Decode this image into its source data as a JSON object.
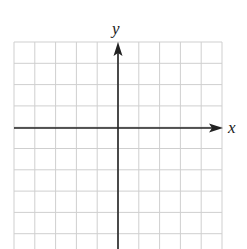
{
  "figure": {
    "type": "blank coordinate grid",
    "x_axis_label": "x",
    "y_axis_label": "y",
    "grid": {
      "columns": 10,
      "rows_visible": 10,
      "left": 14,
      "top": 42,
      "cell_width": 20.8,
      "cell_height": 21.3,
      "origin_column": 5,
      "origin_row": 4,
      "line_color": "#cfcfcf",
      "axis_color": "#222222"
    },
    "top_fragments": [
      "ʿ",
      "‾"
    ]
  }
}
